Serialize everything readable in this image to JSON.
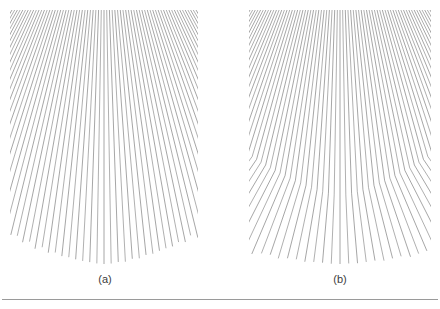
{
  "figure": {
    "background_color": "#ffffff",
    "line_color": "#6e6e6e",
    "caption_color": "#3b3b3b",
    "rule_color": "#9a9a9a"
  },
  "panels": [
    {
      "id": "a",
      "caption": "(a)",
      "type": "straight-radial-fan",
      "description": "Straight lines radiating outward from a vanishing point above the top edge",
      "box": {
        "x": 10,
        "y": 6,
        "width": 188,
        "height": 262
      },
      "line_count": 69,
      "vanishing_point": {
        "x": 94,
        "y": -150
      },
      "top_y": 4,
      "bottom_y": 258,
      "top_half_width": 92,
      "bottom_spread_factor": 2.55
    },
    {
      "id": "b",
      "caption": "(b)",
      "type": "kinked-radial-fan",
      "description": "Lines radiate from a vanishing point then bend at an arc, changing to a steeper outward slope",
      "box": {
        "x": 249,
        "y": 6,
        "width": 182,
        "height": 262
      },
      "line_count": 69,
      "vanishing_point": {
        "x": 91,
        "y": -150
      },
      "top_y": 4,
      "bottom_y": 258,
      "top_half_width": 90,
      "kink_center_y": 190,
      "kink_edge_y": 96,
      "bottom_spread_factor": 1.62
    }
  ],
  "bottom_rule": {
    "name": "horizontal-rule",
    "x": 2,
    "y": 299,
    "width": 436
  }
}
